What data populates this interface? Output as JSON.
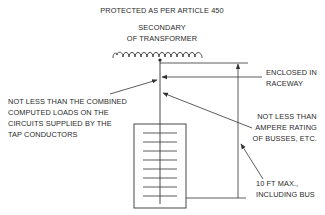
{
  "diagram": {
    "title": "PROTECTED AS PER ARTICLE 450",
    "labels": {
      "secondary_line1": "SECONDARY",
      "secondary_line2": "OF TRANSFORMER",
      "enclosed_line1": "ENCLOSED IN",
      "enclosed_line2": "RACEWAY",
      "combined_line1": "NOT LESS THAN THE COMBINED",
      "combined_line2": "COMPUTED LOADS ON THE",
      "combined_line3": "CIRCUITS SUPPLIED BY THE",
      "combined_line4": "TAP CONDUCTORS",
      "ampere_line1": "NOT LESS THAN",
      "ampere_line2": "AMPERE RATING",
      "ampere_line3": "OF BUSSES, ETC.",
      "length_line1": "10 FT MAX.,",
      "length_line2": "INCLUDING BUS"
    },
    "components": [
      {
        "name": "transformer-secondary-coil",
        "type": "coil"
      },
      {
        "name": "tap-conductor",
        "type": "line"
      },
      {
        "name": "panel-bus",
        "type": "box",
        "bus_ticks": 8
      },
      {
        "name": "length-dimension",
        "type": "dimension-line"
      }
    ],
    "colors": {
      "line": "#333333",
      "text": "#2a2a2a",
      "background": "#ffffff"
    }
  }
}
